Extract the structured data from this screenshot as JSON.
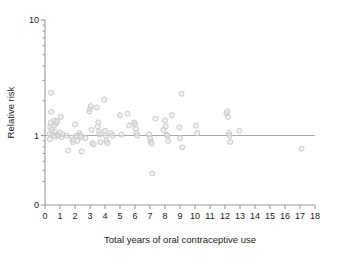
{
  "chart_data": {
    "type": "scatter",
    "title": "",
    "xlabel": "Total years of oral contraceptive use",
    "ylabel": "Relative risk",
    "xlim": [
      0,
      18
    ],
    "ylim": [
      0.3,
      10
    ],
    "yscale": "log",
    "xscale": "linear",
    "grid": false,
    "legend": null,
    "xticks": [
      0,
      1,
      2,
      3,
      4,
      5,
      6,
      7,
      8,
      9,
      10,
      11,
      12,
      13,
      14,
      15,
      16,
      17,
      18
    ],
    "xticklabels": [
      "0",
      "1",
      "2",
      "3",
      "4",
      "5",
      "6",
      "7",
      "8",
      "9",
      "10",
      "11",
      "12",
      "13",
      "14",
      "15",
      "16",
      "17",
      "18"
    ],
    "yticks_major": [
      1,
      10
    ],
    "yticklabels_major": [
      "1",
      "10"
    ],
    "y_axis_origin_label": "0",
    "yticks_minor": [
      2,
      3,
      4,
      5,
      6,
      7,
      8,
      9,
      0.9,
      0.8,
      0.7,
      0.6,
      0.5,
      0.4
    ],
    "reference_line": {
      "y": 1.0,
      "orientation": "horizontal",
      "color": "#a8a8a8"
    },
    "marker": {
      "shape": "circle-open",
      "color": "#c9c9c9",
      "fill": "#e8e8e8",
      "size": 5
    },
    "points": [
      {
        "x": 0.3,
        "y": 1.03
      },
      {
        "x": 0.32,
        "y": 0.93
      },
      {
        "x": 0.35,
        "y": 1.18
      },
      {
        "x": 0.38,
        "y": 1.3
      },
      {
        "x": 0.4,
        "y": 2.35
      },
      {
        "x": 0.42,
        "y": 1.6
      },
      {
        "x": 0.45,
        "y": 1.12
      },
      {
        "x": 0.5,
        "y": 1.05
      },
      {
        "x": 0.55,
        "y": 1.0
      },
      {
        "x": 0.6,
        "y": 1.22
      },
      {
        "x": 0.62,
        "y": 1.35
      },
      {
        "x": 0.65,
        "y": 1.08
      },
      {
        "x": 0.7,
        "y": 0.98
      },
      {
        "x": 0.75,
        "y": 1.28
      },
      {
        "x": 0.8,
        "y": 1.33
      },
      {
        "x": 0.85,
        "y": 1.02
      },
      {
        "x": 0.9,
        "y": 1.0
      },
      {
        "x": 1.0,
        "y": 1.06
      },
      {
        "x": 1.05,
        "y": 1.45
      },
      {
        "x": 1.1,
        "y": 0.97
      },
      {
        "x": 1.2,
        "y": 1.02
      },
      {
        "x": 1.45,
        "y": 1.0
      },
      {
        "x": 1.55,
        "y": 0.74
      },
      {
        "x": 1.8,
        "y": 0.96
      },
      {
        "x": 1.85,
        "y": 0.88
      },
      {
        "x": 1.9,
        "y": 0.92
      },
      {
        "x": 2.0,
        "y": 1.25
      },
      {
        "x": 2.1,
        "y": 1.0
      },
      {
        "x": 2.15,
        "y": 0.9
      },
      {
        "x": 2.3,
        "y": 1.05
      },
      {
        "x": 2.35,
        "y": 1.0
      },
      {
        "x": 2.4,
        "y": 0.97
      },
      {
        "x": 2.45,
        "y": 0.73
      },
      {
        "x": 2.7,
        "y": 0.95
      },
      {
        "x": 2.95,
        "y": 1.62
      },
      {
        "x": 3.0,
        "y": 1.7
      },
      {
        "x": 3.05,
        "y": 1.8
      },
      {
        "x": 3.1,
        "y": 1.12
      },
      {
        "x": 3.15,
        "y": 0.86
      },
      {
        "x": 3.25,
        "y": 0.84
      },
      {
        "x": 3.45,
        "y": 1.75
      },
      {
        "x": 3.5,
        "y": 1.2
      },
      {
        "x": 3.55,
        "y": 1.3
      },
      {
        "x": 3.6,
        "y": 1.08
      },
      {
        "x": 3.65,
        "y": 1.02
      },
      {
        "x": 3.7,
        "y": 0.88
      },
      {
        "x": 3.95,
        "y": 2.05
      },
      {
        "x": 4.0,
        "y": 1.1
      },
      {
        "x": 4.05,
        "y": 1.0
      },
      {
        "x": 4.1,
        "y": 0.9
      },
      {
        "x": 4.15,
        "y": 0.86
      },
      {
        "x": 4.4,
        "y": 1.05
      },
      {
        "x": 4.5,
        "y": 1.0
      },
      {
        "x": 5.0,
        "y": 1.5
      },
      {
        "x": 5.1,
        "y": 1.02
      },
      {
        "x": 5.5,
        "y": 1.55
      },
      {
        "x": 5.6,
        "y": 1.22
      },
      {
        "x": 5.95,
        "y": 1.3
      },
      {
        "x": 6.0,
        "y": 1.25
      },
      {
        "x": 6.05,
        "y": 1.15
      },
      {
        "x": 6.1,
        "y": 1.05
      },
      {
        "x": 6.15,
        "y": 1.0
      },
      {
        "x": 6.95,
        "y": 1.02
      },
      {
        "x": 7.0,
        "y": 0.95
      },
      {
        "x": 7.05,
        "y": 0.88
      },
      {
        "x": 7.1,
        "y": 0.85
      },
      {
        "x": 7.15,
        "y": 0.47
      },
      {
        "x": 7.35,
        "y": 1.4
      },
      {
        "x": 7.9,
        "y": 1.12
      },
      {
        "x": 8.0,
        "y": 1.35
      },
      {
        "x": 8.05,
        "y": 1.2
      },
      {
        "x": 8.1,
        "y": 1.02
      },
      {
        "x": 8.15,
        "y": 1.0
      },
      {
        "x": 8.2,
        "y": 0.9
      },
      {
        "x": 8.45,
        "y": 1.5
      },
      {
        "x": 8.95,
        "y": 1.18
      },
      {
        "x": 9.0,
        "y": 0.95
      },
      {
        "x": 9.1,
        "y": 2.3
      },
      {
        "x": 9.15,
        "y": 0.79
      },
      {
        "x": 10.05,
        "y": 1.22
      },
      {
        "x": 10.15,
        "y": 1.05
      },
      {
        "x": 12.1,
        "y": 1.55
      },
      {
        "x": 12.15,
        "y": 1.62
      },
      {
        "x": 12.2,
        "y": 1.45
      },
      {
        "x": 12.25,
        "y": 1.05
      },
      {
        "x": 12.3,
        "y": 1.0
      },
      {
        "x": 12.35,
        "y": 0.88
      },
      {
        "x": 12.95,
        "y": 1.1
      },
      {
        "x": 17.1,
        "y": 0.77
      }
    ]
  }
}
